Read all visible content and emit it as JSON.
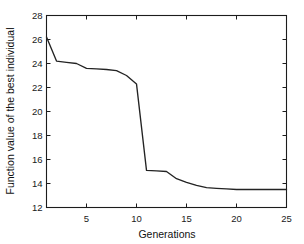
{
  "figure": {
    "background_color": "#ffffff",
    "line_color": "#232323",
    "axis_color": "#1c1c1c"
  },
  "chart_data": {
    "type": "line",
    "title": "",
    "xlabel": "Generations",
    "ylabel": "Function value of the best individual",
    "xlim": [
      1,
      25
    ],
    "ylim": [
      12,
      28
    ],
    "xticks": [
      5,
      10,
      15,
      20,
      25
    ],
    "yticks": [
      12,
      14,
      16,
      18,
      20,
      22,
      24,
      26,
      28
    ],
    "xtick_labels": [
      "5",
      "10",
      "15",
      "20",
      "25"
    ],
    "ytick_labels": [
      "12",
      "14",
      "16",
      "18",
      "20",
      "22",
      "24",
      "26",
      "28"
    ],
    "grid": false,
    "legend": null,
    "series": [
      {
        "name": "best individual",
        "x": [
          1,
          2,
          3,
          4,
          5,
          6,
          7,
          8,
          9,
          10,
          11,
          12,
          13,
          14,
          15,
          16,
          17,
          18,
          19,
          20,
          21,
          22,
          23,
          24,
          25
        ],
        "values": [
          26.2,
          24.2,
          24.1,
          24.0,
          23.6,
          23.55,
          23.5,
          23.4,
          23.0,
          22.3,
          15.1,
          15.05,
          15.0,
          14.4,
          14.1,
          13.85,
          13.65,
          13.6,
          13.55,
          13.5,
          13.5,
          13.5,
          13.5,
          13.5,
          13.5
        ]
      }
    ]
  }
}
